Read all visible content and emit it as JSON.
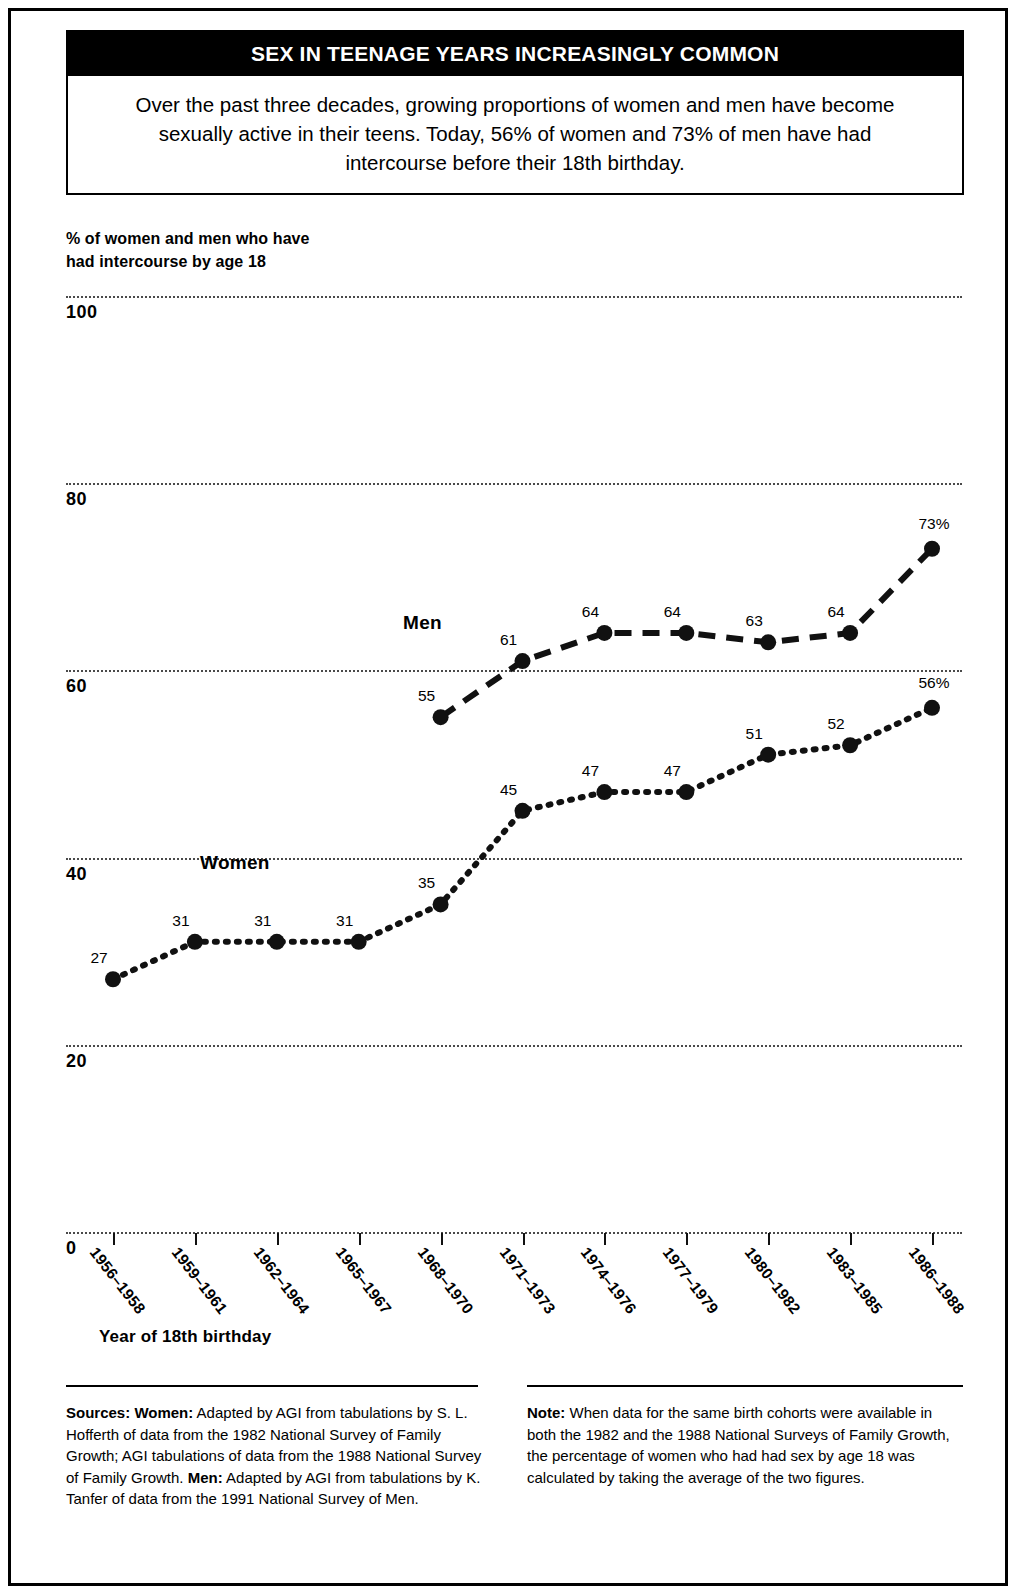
{
  "header": {
    "title": "SEX IN TEENAGE YEARS INCREASINGLY COMMON",
    "subtitle": "Over the past three decades, growing proportions of women and men have become sexually active in their teens. Today, 56% of women and 73% of men have had intercourse before their 18th birthday."
  },
  "chart_data": {
    "type": "line",
    "title": "SEX IN TEENAGE YEARS INCREASINGLY COMMON",
    "ylabel": "% of women and men who have had intercourse by age 18",
    "xlabel": "Year of 18th birthday",
    "categories": [
      "1956–1958",
      "1959–1961",
      "1962–1964",
      "1965–1967",
      "1968–1970",
      "1971–1973",
      "1974–1976",
      "1977–1979",
      "1980–1982",
      "1983–1985",
      "1986–1988"
    ],
    "ylim": [
      0,
      100
    ],
    "yticks": [
      0,
      20,
      40,
      60,
      80,
      100
    ],
    "ytick_labels": [
      "0",
      "20",
      "40",
      "60",
      "80",
      "100"
    ],
    "grid": "horizontal-dotted",
    "legend": "inline-series-labels",
    "series": [
      {
        "name": "Women",
        "style": "dotted",
        "values": [
          27,
          31,
          31,
          31,
          35,
          45,
          47,
          47,
          51,
          52,
          56
        ],
        "point_labels": [
          "27",
          "31",
          "31",
          "31",
          "35",
          "45",
          "47",
          "47",
          "51",
          "52",
          "56%"
        ]
      },
      {
        "name": "Men",
        "style": "dashed",
        "values": [
          null,
          null,
          null,
          null,
          55,
          61,
          64,
          64,
          63,
          64,
          73
        ],
        "point_labels": [
          null,
          null,
          null,
          null,
          "55",
          "61",
          "64",
          "64",
          "63",
          "64",
          "73%"
        ]
      }
    ]
  },
  "footer": {
    "sources_label": "Sources:",
    "sources_women_label": "Women:",
    "sources_women_text": " Adapted by AGI from tabulations by S. L. Hofferth of data from the 1982 National Survey of Family Growth; AGI tabulations of data from the 1988 National Survey of Family Growth. ",
    "sources_men_label": "Men:",
    "sources_men_text": " Adapted by AGI from tabulations by K. Tanfer of data from the 1991 National Survey of Men.",
    "note_label": "Note:",
    "note_text": " When data for the same birth cohorts were available in both the 1982 and the 1988 National Surveys of Family Growth, the percentage of women who had had sex by age 18 was calculated by taking the average of the two figures."
  }
}
